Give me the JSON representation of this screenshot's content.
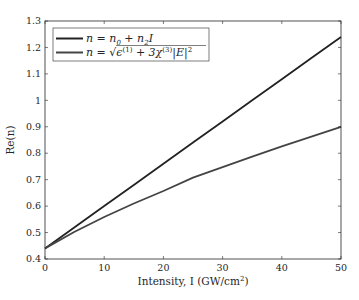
{
  "chart_data": {
    "type": "line",
    "title": "",
    "xlabel": "Intensity, I (GW/cm²)",
    "ylabel": "Re(n)",
    "xlim": [
      0,
      50
    ],
    "ylim": [
      0.4,
      1.3
    ],
    "xticks": [
      0,
      10,
      20,
      30,
      40,
      50
    ],
    "xtick_labels": [
      "0",
      "10",
      "20",
      "30",
      "40",
      "50"
    ],
    "yticks": [
      0.4,
      0.5,
      0.6,
      0.7,
      0.8,
      0.9,
      1.0,
      1.1,
      1.2,
      1.3
    ],
    "ytick_labels": [
      "0.4",
      "0.5",
      "0.6",
      "0.7",
      "0.8",
      "0.9",
      "1",
      "1.1",
      "1.2",
      "1.3"
    ],
    "grid": false,
    "legend_position": "upper left",
    "x": [
      0,
      5,
      10,
      15,
      20,
      25,
      30,
      35,
      40,
      45,
      50
    ],
    "series": [
      {
        "name": "n = n0 + n2 I",
        "color": "#222222",
        "values": [
          0.44,
          0.52,
          0.6,
          0.68,
          0.76,
          0.84,
          0.92,
          1.0,
          1.08,
          1.16,
          1.24
        ]
      },
      {
        "name": "n = sqrt(ε(1) + 3χ(3)|E|²)",
        "color": "#444444",
        "values": [
          0.44,
          0.503,
          0.559,
          0.61,
          0.657,
          0.708,
          0.747,
          0.787,
          0.826,
          0.863,
          0.9
        ]
      }
    ]
  },
  "legend": {
    "entries": [
      {
        "label_main": "n = n",
        "sub0": "0",
        "mid": " + n",
        "sub2": "2",
        "tail": "I"
      },
      {
        "label_main": "n = √",
        "eps": "ϵ",
        "sup1": "(1)",
        "plus": " + 3χ",
        "sup3": "(3)",
        "abs": "|E|",
        "sup2": "2"
      }
    ]
  },
  "axes": {
    "xlabel_main": "Intensity, I (GW/cm",
    "xlabel_sup": "2",
    "xlabel_close": ")",
    "ylabel": "Re(n)"
  }
}
